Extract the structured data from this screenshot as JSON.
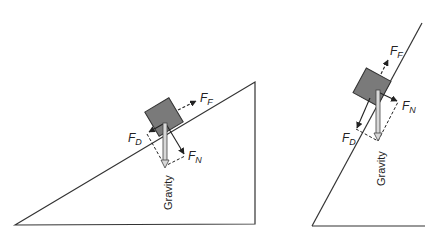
{
  "diagrams": [
    {
      "name": "shallow-incline",
      "labels": {
        "friction": {
          "main": "F",
          "sub": "F"
        },
        "downslope": {
          "main": "F",
          "sub": "D"
        },
        "normal": {
          "main": "F",
          "sub": "N"
        },
        "gravity": "Gravity"
      }
    },
    {
      "name": "steep-incline",
      "labels": {
        "friction": {
          "main": "F",
          "sub": "F"
        },
        "downslope": {
          "main": "F",
          "sub": "D"
        },
        "normal": {
          "main": "F",
          "sub": "N"
        },
        "gravity": "Gravity"
      }
    }
  ],
  "colors": {
    "line": "#333333",
    "block": "#7a7a7a",
    "block_stroke": "#333333",
    "gravity_fill": "#d8d8d8"
  }
}
